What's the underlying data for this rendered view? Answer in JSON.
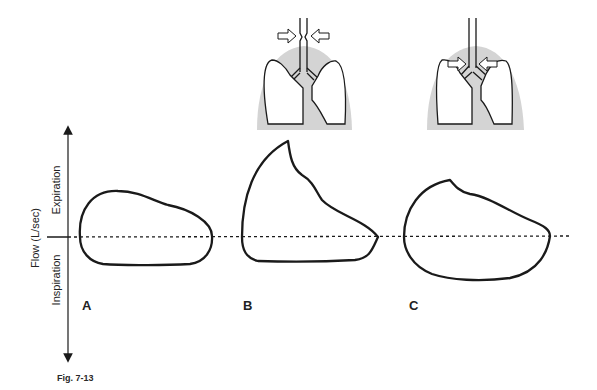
{
  "figure": {
    "caption": "Fig. 7-13",
    "y_axis": {
      "label": "Flow (L/sec)",
      "upper_label": "Expiration",
      "lower_label": "Inspiration"
    },
    "panels": [
      {
        "id": "A",
        "label": "A",
        "description": "Normal flow-volume loop"
      },
      {
        "id": "B",
        "label": "B",
        "description": "Fixed/variable extrathoracic obstruction loop with sharp expiratory peak",
        "illustration": "lungs with arrows compressing upper trachea (extrathoracic)"
      },
      {
        "id": "C",
        "label": "C",
        "description": "Loop with blunted expiratory peak",
        "illustration": "lungs with arrows compressing airways at carina (intrathoracic)"
      }
    ],
    "colors": {
      "stroke": "#1a1a1a",
      "chest_shading": "#d4d4d4"
    }
  }
}
